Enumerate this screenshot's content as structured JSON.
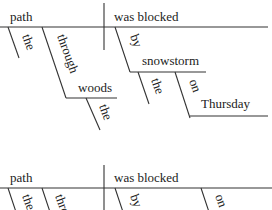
{
  "diagram_type": "sentence diagram (Reed-Kellogg)",
  "diagrams": [
    {
      "id": "full",
      "subject": "path",
      "predicate": "was blocked",
      "modifiers": {
        "subject_article": "the",
        "subject_preposition": "through",
        "subject_prep_object": "woods",
        "subject_prep_object_article": "the",
        "predicate_preposition": "by",
        "predicate_prep_object": "snowstorm",
        "predicate_prep_object_article": "the",
        "second_preposition": "on",
        "second_prep_object": "Thursday"
      }
    },
    {
      "id": "partial",
      "subject": "path",
      "predicate": "was blocked",
      "visible_fragments": [
        "the",
        "through",
        "by",
        "on"
      ]
    }
  ]
}
